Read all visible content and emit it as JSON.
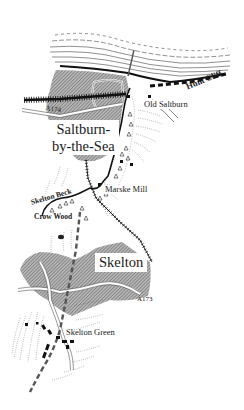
{
  "map": {
    "title": "Saltburn-by-the-Sea to Skelton Green walk route",
    "colors": {
      "background": "#ffffff",
      "urban_hatch": "#8c8c8c",
      "ink": "#1a1a1a",
      "route": "#555555",
      "coast_lines": "#333333"
    },
    "labels": {
      "saltburn_line1": "Saltburn-",
      "saltburn_line2": "by-the-Sea",
      "skelton": "Skelton",
      "old_saltburn": "Old Saltburn",
      "hunt_cliff": "Hunt Cliff",
      "marske_mill": "Marske Mill",
      "skelton_beck": "Skelton Beck",
      "crow_wood": "Crow Wood",
      "skelton_green": "Skelton Green",
      "road_a174": "A174",
      "road_a173": "A173"
    },
    "legend_features": [
      "urban-area-hatched",
      "dashed-walking-route",
      "railway-line",
      "woodland-tree-symbols",
      "beck-river",
      "cliff-coastline",
      "pier"
    ]
  }
}
